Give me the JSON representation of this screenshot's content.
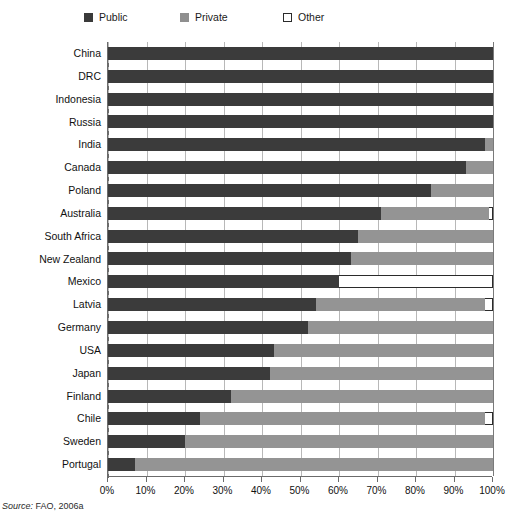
{
  "legend": {
    "items": [
      {
        "label": "Public",
        "swatch": "dark-square-icon",
        "color": "#3a3a3a"
      },
      {
        "label": "Private",
        "swatch": "grey-square-icon",
        "color": "#8f8f8f"
      },
      {
        "label": "Other",
        "swatch": "hollow-square-icon",
        "color": "#ffffff"
      }
    ]
  },
  "source": {
    "prefix": "Source:",
    "text": "FAO, 2006a"
  },
  "axis": {
    "x_ticks": [
      "0%",
      "10%",
      "20%",
      "30%",
      "40%",
      "50%",
      "60%",
      "70%",
      "80%",
      "90%",
      "100%"
    ]
  },
  "chart_data": {
    "type": "bar",
    "orientation": "horizontal",
    "stacked": true,
    "stack_total": 100,
    "title": "",
    "subtitle": "",
    "xlabel": "",
    "ylabel": "",
    "xlim": [
      0,
      100
    ],
    "xticks": [
      0,
      10,
      20,
      30,
      40,
      50,
      60,
      70,
      80,
      90,
      100
    ],
    "xtick_labels": [
      "0%",
      "10%",
      "20%",
      "30%",
      "40%",
      "50%",
      "60%",
      "70%",
      "80%",
      "90%",
      "100%"
    ],
    "grid": "vertical",
    "legend_position": "top",
    "legend_entries": [
      "Public",
      "Private",
      "Other"
    ],
    "colors": {
      "Public": "#3b3b3b",
      "Private": "#949494",
      "Other": "#ffffff"
    },
    "categories": [
      "China",
      "DRC",
      "Indonesia",
      "Russia",
      "India",
      "Canada",
      "Poland",
      "Australia",
      "South Africa",
      "New Zealand",
      "Mexico",
      "Latvia",
      "Germany",
      "USA",
      "Japan",
      "Finland",
      "Chile",
      "Sweden",
      "Portugal"
    ],
    "series": [
      {
        "name": "Public",
        "values": [
          100,
          100,
          100,
          100,
          98,
          93,
          84,
          71,
          65,
          63,
          60,
          54,
          52,
          43,
          42,
          32,
          24,
          20,
          7
        ]
      },
      {
        "name": "Private",
        "values": [
          0,
          0,
          0,
          0,
          2,
          7,
          16,
          28,
          35,
          37,
          0,
          44,
          48,
          57,
          58,
          68,
          74,
          80,
          93
        ]
      },
      {
        "name": "Other",
        "values": [
          0,
          0,
          0,
          0,
          0,
          0,
          0,
          1,
          0,
          0,
          40,
          2,
          0,
          0,
          0,
          0,
          2,
          0,
          0
        ]
      }
    ],
    "rows": [
      {
        "category": "China",
        "public": 100,
        "private": 0,
        "other": 0
      },
      {
        "category": "DRC",
        "public": 100,
        "private": 0,
        "other": 0
      },
      {
        "category": "Indonesia",
        "public": 100,
        "private": 0,
        "other": 0
      },
      {
        "category": "Russia",
        "public": 100,
        "private": 0,
        "other": 0
      },
      {
        "category": "India",
        "public": 98,
        "private": 2,
        "other": 0
      },
      {
        "category": "Canada",
        "public": 93,
        "private": 7,
        "other": 0
      },
      {
        "category": "Poland",
        "public": 84,
        "private": 16,
        "other": 0
      },
      {
        "category": "Australia",
        "public": 71,
        "private": 28,
        "other": 1
      },
      {
        "category": "South Africa",
        "public": 65,
        "private": 35,
        "other": 0
      },
      {
        "category": "New Zealand",
        "public": 63,
        "private": 37,
        "other": 0
      },
      {
        "category": "Mexico",
        "public": 60,
        "private": 0,
        "other": 40
      },
      {
        "category": "Latvia",
        "public": 54,
        "private": 44,
        "other": 2
      },
      {
        "category": "Germany",
        "public": 52,
        "private": 48,
        "other": 0
      },
      {
        "category": "USA",
        "public": 43,
        "private": 57,
        "other": 0
      },
      {
        "category": "Japan",
        "public": 42,
        "private": 58,
        "other": 0
      },
      {
        "category": "Finland",
        "public": 32,
        "private": 68,
        "other": 0
      },
      {
        "category": "Chile",
        "public": 24,
        "private": 74,
        "other": 2
      },
      {
        "category": "Sweden",
        "public": 20,
        "private": 80,
        "other": 0
      },
      {
        "category": "Portugal",
        "public": 7,
        "private": 93,
        "other": 0
      }
    ]
  }
}
